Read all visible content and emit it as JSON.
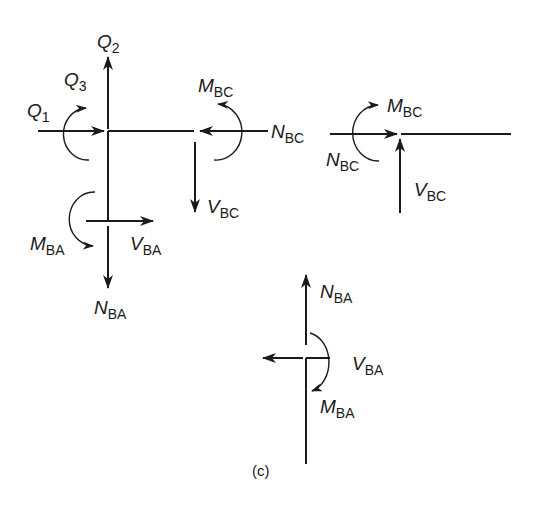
{
  "figure": {
    "caption": "(c)",
    "panels": {
      "joint": {
        "labels": {
          "Q2": {
            "main": "Q",
            "sub": "2"
          },
          "Q3": {
            "main": "Q",
            "sub": "3"
          },
          "Q1": {
            "main": "Q",
            "sub": "1"
          },
          "MBC": {
            "main": "M",
            "sub": "BC"
          },
          "NBC": {
            "main": "N",
            "sub": "BC"
          },
          "VBC": {
            "main": "V",
            "sub": "BC"
          },
          "MBA": {
            "main": "M",
            "sub": "BA"
          },
          "VBA": {
            "main": "V",
            "sub": "BA"
          },
          "NBA": {
            "main": "N",
            "sub": "BA"
          }
        }
      },
      "member_bc": {
        "labels": {
          "MBC": {
            "main": "M",
            "sub": "BC"
          },
          "NBC": {
            "main": "N",
            "sub": "BC"
          },
          "VBC": {
            "main": "V",
            "sub": "BC"
          }
        }
      },
      "member_ba": {
        "labels": {
          "NBA": {
            "main": "N",
            "sub": "BA"
          },
          "VBA": {
            "main": "V",
            "sub": "BA"
          },
          "MBA": {
            "main": "M",
            "sub": "BA"
          }
        }
      }
    },
    "colors": {
      "ink": "#1a1a1a",
      "background": "#ffffff"
    }
  }
}
